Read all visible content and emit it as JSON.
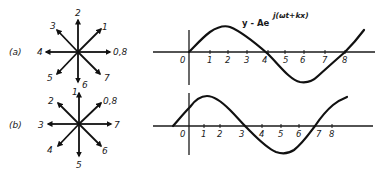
{
  "diagram": {
    "equation": {
      "main": "y - Ae",
      "superscript": "j(ωt+kx)"
    },
    "parts": [
      {
        "id": "a",
        "label": "(a)",
        "phasor_labels": {
          "right": "0,8",
          "upper_right": "1",
          "up": "2",
          "upper_left": "3",
          "left": "4",
          "lower_left": "5",
          "down": "6",
          "lower_right": "7"
        },
        "axis_origin_label": "0",
        "tick_labels": [
          "1",
          "2",
          "3",
          "4",
          "5",
          "6",
          "7",
          "8"
        ]
      },
      {
        "id": "b",
        "label": "(b)",
        "phasor_labels": {
          "upper_right": "0,8",
          "up": "1",
          "upper_left": "2",
          "left": "3",
          "lower_left": "4",
          "down": "5",
          "lower_right": "6",
          "right": "7"
        },
        "axis_origin_label": "0",
        "tick_labels": [
          "1",
          "2",
          "3",
          "4",
          "5",
          "6",
          "7",
          "8"
        ]
      }
    ]
  },
  "colors": {
    "ink": "#111111",
    "background": "#ffffff"
  }
}
